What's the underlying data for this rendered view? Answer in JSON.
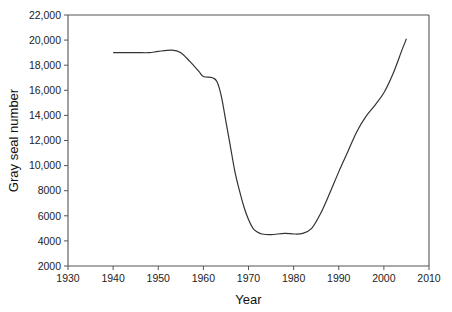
{
  "chart_data": {
    "type": "line",
    "title": "",
    "xlabel": "Year",
    "ylabel": "Gray seal number",
    "xlim": [
      1930,
      2010
    ],
    "ylim": [
      2000,
      22000
    ],
    "x_ticks": [
      1930,
      1940,
      1950,
      1960,
      1970,
      1980,
      1990,
      2000,
      2010
    ],
    "x_tick_labels": [
      "1930",
      "1940",
      "1950",
      "1960",
      "1970",
      "1980",
      "1990",
      "2000",
      "2010"
    ],
    "y_ticks": [
      2000,
      4000,
      6000,
      8000,
      10000,
      12000,
      14000,
      16000,
      18000,
      20000,
      22000
    ],
    "y_tick_labels": [
      "2000",
      "4000",
      "6000",
      "8000",
      "10,000",
      "12,000",
      "14,000",
      "16,000",
      "18,000",
      "20,000",
      "22,000"
    ],
    "grid": false,
    "legend": null,
    "series": [
      {
        "name": "Gray seal number",
        "color": "#333333",
        "x": [
          1940,
          1945,
          1948,
          1950,
          1953,
          1955,
          1957,
          1959,
          1960,
          1962,
          1963,
          1964,
          1965,
          1966,
          1967,
          1968,
          1969,
          1970,
          1971,
          1972,
          1973,
          1975,
          1978,
          1980,
          1982,
          1984,
          1986,
          1988,
          1990,
          1992,
          1994,
          1996,
          1998,
          2000,
          2002,
          2004,
          2005
        ],
        "values": [
          19000,
          19000,
          19000,
          19100,
          19200,
          19000,
          18300,
          17500,
          17100,
          17000,
          16700,
          15500,
          13500,
          11500,
          9500,
          8000,
          6700,
          5700,
          5000,
          4700,
          4550,
          4500,
          4600,
          4550,
          4600,
          5000,
          6200,
          7800,
          9500,
          11100,
          12700,
          13900,
          14800,
          15800,
          17300,
          19200,
          20100
        ]
      }
    ]
  },
  "layout": {
    "plot_left": 68,
    "plot_right": 429,
    "plot_top": 15,
    "plot_bottom": 266
  }
}
